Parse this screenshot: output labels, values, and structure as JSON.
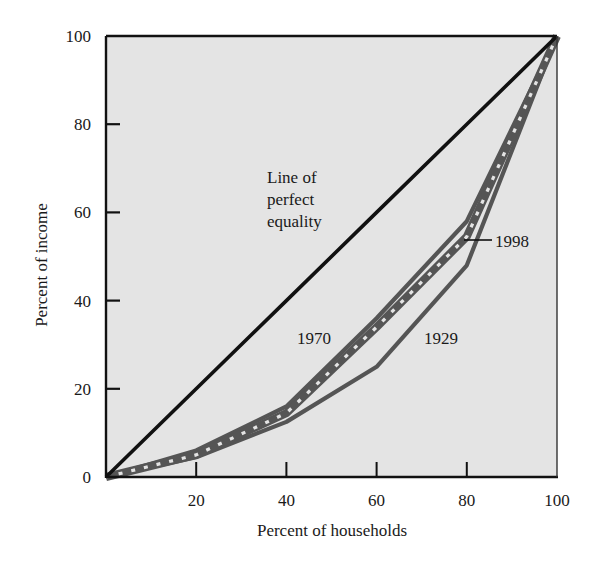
{
  "chart_data": {
    "type": "line",
    "title": "",
    "xlabel": "Percent of households",
    "ylabel": "Percent of income",
    "xlim": [
      0,
      100
    ],
    "ylim": [
      0,
      100
    ],
    "grid": false,
    "legend": "none (inline labels)",
    "x_ticks": [
      "20",
      "40",
      "60",
      "80",
      "100"
    ],
    "y_ticks": [
      "0",
      "20",
      "40",
      "60",
      "80",
      "100"
    ],
    "x": [
      0,
      20,
      40,
      60,
      80,
      100
    ],
    "series": [
      {
        "name": "Line of perfect equality",
        "values": [
          0,
          20,
          40,
          60,
          80,
          100
        ],
        "style": "solid-black"
      },
      {
        "name": "1929",
        "values": [
          0,
          4.5,
          12.5,
          25,
          48,
          100
        ],
        "style": "solid-gray"
      },
      {
        "name": "1970",
        "values": [
          0,
          6,
          16,
          36,
          58,
          100
        ],
        "style": "solid-gray"
      },
      {
        "name": "1998",
        "values": [
          0,
          5,
          14.5,
          34,
          54.5,
          100
        ],
        "style": "dashed-gray"
      }
    ],
    "annotations": {
      "equality_label": [
        "Line of",
        "perfect",
        "equality"
      ],
      "label_1970": "1970",
      "label_1929": "1929",
      "label_1998": "1998"
    },
    "colors": {
      "plot_bg": "#e4e4e4",
      "equality_line": "#111111",
      "curves": "#555555",
      "axis": "#111111"
    }
  }
}
